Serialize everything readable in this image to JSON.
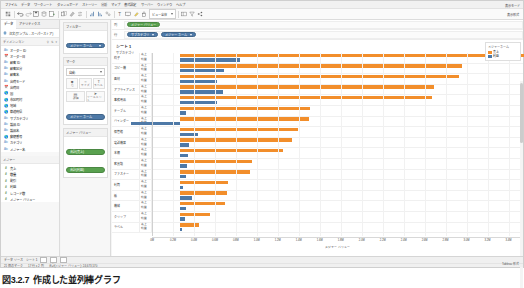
{
  "app": {
    "title": "Tableau Desktop",
    "menu": [
      "ファイル",
      "データ",
      "ワークシート",
      "ダッシュボード",
      "ストーリー",
      "分析",
      "マップ",
      "書式設定",
      "サーバー",
      "ウィンドウ",
      "ヘルプ"
    ],
    "menu_right": [
      "表示モード"
    ]
  },
  "toolbar": {
    "fit_label": "ビュー全体",
    "show_me": "表示形式",
    "buttons": [
      "start-page",
      "undo",
      "redo",
      "save",
      "new-data-source",
      "new-worksheet",
      "duplicate",
      "clear-sheet",
      "swap-rows-cols",
      "sort-ascending",
      "sort-descending",
      "highlight",
      "group",
      "show-labels",
      "presentation-mode",
      "fit",
      "fix-axes",
      "show-cards"
    ]
  },
  "left_pane": {
    "tabs": [
      {
        "label": "データ",
        "active": true
      },
      {
        "label": "アナリティクス",
        "active": false
      }
    ],
    "datasource": "注文 (サンプル - スーパーストア)",
    "section_label": "ディメンション",
    "section_icons": [
      "search",
      "sort",
      "menu"
    ],
    "dimensions": [
      {
        "label": "オーダー ID",
        "icon": "abc"
      },
      {
        "label": "オーダー日",
        "icon": "date"
      },
      {
        "label": "顧客 ID",
        "icon": "abc"
      },
      {
        "label": "顧客区分",
        "icon": "abc"
      },
      {
        "label": "顧客名",
        "icon": "abc"
      },
      {
        "label": "出荷モード",
        "icon": "abc"
      },
      {
        "label": "出荷日",
        "icon": "date"
      },
      {
        "label": "国",
        "icon": "geo"
      },
      {
        "label": "市区町村",
        "icon": "geo"
      },
      {
        "label": "地域",
        "icon": "geo"
      },
      {
        "label": "都道府県",
        "icon": "geo"
      },
      {
        "label": "サブカテゴリ",
        "icon": "abc"
      },
      {
        "label": "製品 ID",
        "icon": "abc"
      },
      {
        "label": "製品名",
        "icon": "abc"
      },
      {
        "label": "郵便番号",
        "icon": "geo"
      },
      {
        "label": "カテゴリ",
        "icon": "abc"
      },
      {
        "label": "メジャー名",
        "icon": "abc"
      }
    ],
    "measures_label": "メジャー",
    "measures": [
      {
        "label": "売上",
        "icon": "num"
      },
      {
        "label": "数量",
        "icon": "num"
      },
      {
        "label": "割引",
        "icon": "num"
      },
      {
        "label": "利益",
        "icon": "num"
      },
      {
        "label": "レコード数",
        "icon": "num"
      },
      {
        "label": "メジャー バリュー",
        "icon": "num"
      }
    ]
  },
  "cards": {
    "filters": {
      "title": "フィルター",
      "pills": [
        {
          "label": "メジャー ネーム",
          "color": "blue"
        }
      ]
    },
    "marks": {
      "title": "マーク",
      "mark_type": "自動",
      "buttons": [
        {
          "glyph": "■",
          "label": "色"
        },
        {
          "glyph": "○",
          "label": "サイズ"
        },
        {
          "glyph": "T",
          "label": "ラベル"
        },
        {
          "glyph": "▤",
          "label": "詳細"
        },
        {
          "glyph": "➤",
          "label": "ツールヒント"
        }
      ],
      "pills": [
        {
          "label": "メジャー ネーム",
          "color": "blue"
        }
      ]
    },
    "color_legend": {
      "title": "メジャー バリュー",
      "pills": [
        {
          "label": "合計(売上)",
          "color": "green"
        },
        {
          "label": "合計(利益)",
          "color": "green"
        }
      ]
    }
  },
  "shelves": {
    "columns_label": "列",
    "columns_pills": [
      {
        "label": "メジャー バリュー",
        "color": "green"
      }
    ],
    "rows_label": "行",
    "rows_pills": [
      {
        "label": "サブカテゴリ",
        "color": "blue"
      },
      {
        "label": "メジャー ネーム",
        "color": "blue"
      }
    ]
  },
  "sheet": {
    "title": "シート 1",
    "row_header_title": "サブカテゴリ"
  },
  "legend": {
    "title": "メジャー ネーム",
    "items": [
      {
        "label": "売上",
        "color": "#f28e2b"
      },
      {
        "label": "利益",
        "color": "#4e79a7"
      }
    ]
  },
  "status_bar": {
    "tabs": [
      "データ ソース",
      "シート 1"
    ],
    "sheet_icons": [
      "new-worksheet",
      "new-dashboard",
      "new-story"
    ],
    "info": [
      "21 個のマーク",
      "17 行 x 2 列",
      "合計(メジャー バリュー): 24,673,570"
    ],
    "right": "Tableau 形式"
  },
  "caption": {
    "number": "図3.2.7",
    "text": "作成した並列棒グラフ"
  },
  "chart_data": {
    "type": "bar",
    "title": "シート 1",
    "orientation": "horizontal",
    "xlabel": "メジャー バリュー",
    "ylabel": "サブカテゴリ",
    "xlim": [
      0,
      3500000
    ],
    "grid": true,
    "legend_position": "right",
    "xticks": [
      "0M",
      "0.2M",
      "0.4M",
      "0.6M",
      "0.8M",
      "1.0M",
      "1.2M",
      "1.4M",
      "1.6M",
      "1.8M",
      "2.0M",
      "2.2M",
      "2.4M",
      "2.6M",
      "2.8M",
      "3.0M",
      "3.2M",
      "3.4M"
    ],
    "xtick_values": [
      0,
      200000,
      400000,
      600000,
      800000,
      1000000,
      1200000,
      1400000,
      1600000,
      1800000,
      2000000,
      2200000,
      2400000,
      2600000,
      2800000,
      3000000,
      3200000,
      3400000
    ],
    "measure_labels": {
      "sales": "売上",
      "profit": "利益"
    },
    "categories": [
      "椅子",
      "コピー機",
      "画材",
      "アプライアンス",
      "事務用品",
      "テーブル",
      "バインダー",
      "保管箱",
      "電話機器",
      "本棚",
      "家具類",
      "ファスナー",
      "封筒",
      "紙",
      "機械",
      "クリップ",
      "ラベル"
    ],
    "series": [
      {
        "name": "売上",
        "color": "#f28e2b",
        "values": [
          3290000,
          2690000,
          2660000,
          2420000,
          2400000,
          1240000,
          1230000,
          1130000,
          1070000,
          980000,
          690000,
          670000,
          460000,
          450000,
          430000,
          290000,
          180000
        ]
      },
      {
        "name": "利益",
        "color": "#4e79a7",
        "values": [
          570000,
          420000,
          350000,
          410000,
          350000,
          60000,
          -470000,
          170000,
          90000,
          80000,
          70000,
          60000,
          30000,
          110000,
          60000,
          50000,
          20000
        ]
      }
    ]
  }
}
